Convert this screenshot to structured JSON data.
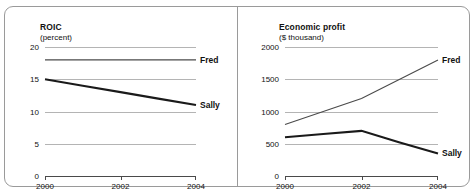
{
  "figure": {
    "width": 475,
    "height": 194,
    "background": "#ffffff",
    "border_color": "#9a9a9a",
    "gridline_color": "#b4b4b4",
    "axis_color": "#4a4a4a"
  },
  "chart_data": [
    {
      "type": "line",
      "panel": "left",
      "title": "ROIC",
      "subtitle": "(percent)",
      "xlabel": "",
      "ylabel": "percent",
      "x": [
        2000,
        2001,
        2002,
        2003,
        2004
      ],
      "xticks": [
        2000,
        2002,
        2004
      ],
      "xtick_labels": [
        "2000",
        "2002",
        "2004"
      ],
      "xlim": [
        2000,
        2004
      ],
      "yticks": [
        0,
        5,
        10,
        15,
        20
      ],
      "ytick_labels": [
        "0",
        "5",
        "10",
        "15",
        "20"
      ],
      "ylim": [
        0,
        20
      ],
      "grid": true,
      "legend": "inline-right",
      "series": [
        {
          "name": "Fred",
          "label": "Fred",
          "values": [
            18,
            18,
            18,
            18,
            18
          ],
          "color": "#4a4a4a",
          "width": 1.1
        },
        {
          "name": "Sally",
          "label": "Sally",
          "values": [
            15,
            14,
            13,
            12,
            11
          ],
          "color": "#1a1a1a",
          "width": 2.1
        }
      ]
    },
    {
      "type": "line",
      "panel": "right",
      "title": "Economic profit",
      "subtitle": "($ thousand)",
      "xlabel": "",
      "ylabel": "$ thousand",
      "x": [
        2000,
        2001,
        2002,
        2003,
        2004
      ],
      "xticks": [
        2000,
        2002,
        2004
      ],
      "xtick_labels": [
        "2000",
        "2002",
        "2004"
      ],
      "xlim": [
        2000,
        2004
      ],
      "yticks": [
        0,
        500,
        1000,
        1500,
        2000
      ],
      "ytick_labels": [
        "0",
        "500",
        "1000",
        "1500",
        "2000"
      ],
      "ylim": [
        0,
        2000
      ],
      "grid": true,
      "legend": "inline-right",
      "series": [
        {
          "name": "Fred",
          "label": "Fred",
          "values": [
            800,
            1000,
            1200,
            1500,
            1800
          ],
          "color": "#4a4a4a",
          "width": 1.1
        },
        {
          "name": "Sally",
          "label": "Sally",
          "values": [
            600,
            650,
            700,
            520,
            350
          ],
          "color": "#1a1a1a",
          "width": 2.1
        }
      ]
    }
  ],
  "geometry": {
    "left": {
      "plot_x": 41,
      "plot_y": 41,
      "plot_w": 151,
      "plot_h": 129,
      "title_x": 36,
      "title_y": 16,
      "subtitle_x": 36,
      "subtitle_y": 27,
      "ylabel_right": 37,
      "label_x": 196
    },
    "right": {
      "plot_x": 47,
      "plot_y": 41,
      "plot_w": 153,
      "plot_h": 129,
      "title_x": 41,
      "title_y": 16,
      "subtitle_x": 41,
      "subtitle_y": 27,
      "ylabel_right": 43,
      "label_x": 204
    }
  }
}
